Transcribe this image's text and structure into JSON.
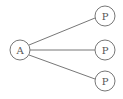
{
  "diagram": {
    "nodes": [
      {
        "id": "a",
        "label": "A",
        "cx": 20,
        "cy": 50
      },
      {
        "id": "p1",
        "label": "P",
        "cx": 105,
        "cy": 16
      },
      {
        "id": "p2",
        "label": "P",
        "cx": 105,
        "cy": 50
      },
      {
        "id": "p3",
        "label": "P",
        "cx": 105,
        "cy": 81
      }
    ],
    "edges": [
      {
        "from": "A",
        "to": "P (top)"
      },
      {
        "from": "A",
        "to": "P (middle)"
      },
      {
        "from": "A",
        "to": "P (bottom)"
      }
    ],
    "colors": {
      "stroke": "#666666",
      "text": "#555555",
      "background": "#ffffff"
    }
  }
}
